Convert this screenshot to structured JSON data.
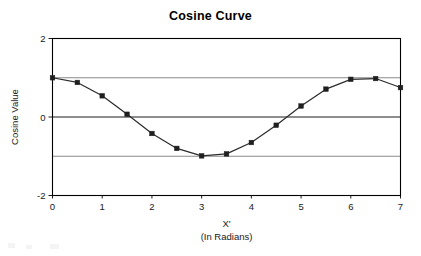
{
  "chart_data": {
    "type": "line",
    "title": "Cosine Curve",
    "xlabel": "X'",
    "xlabel_sub": "(In Radians)",
    "ylabel": "Cosine Value",
    "xlim": [
      0,
      7
    ],
    "ylim": [
      -2,
      2
    ],
    "grid": true,
    "gridlines_y": [
      1,
      0,
      -1
    ],
    "legend": "none",
    "marker": "square",
    "line_color": "#2b2b2b",
    "marker_color": "#1f1f1f",
    "xticks": [
      0,
      1,
      2,
      3,
      4,
      5,
      6,
      7
    ],
    "xtick_labels": [
      "0",
      "1",
      "2",
      "3",
      "4",
      "5",
      "6",
      "7"
    ],
    "yticks": [
      2,
      0,
      -2
    ],
    "ytick_labels": [
      "2",
      "0",
      "-2"
    ],
    "x": [
      0,
      0.5,
      1,
      1.5,
      2,
      2.5,
      3,
      3.5,
      4,
      4.5,
      5,
      5.5,
      6,
      6.5,
      7
    ],
    "values": [
      1,
      0.88,
      0.54,
      0.07,
      -0.42,
      -0.8,
      -0.99,
      -0.94,
      -0.65,
      -0.21,
      0.28,
      0.71,
      0.96,
      0.98,
      0.75
    ],
    "series": [
      {
        "name": "Cosine Value",
        "values": [
          1,
          0.88,
          0.54,
          0.07,
          -0.42,
          -0.8,
          -0.99,
          -0.94,
          -0.65,
          -0.21,
          0.28,
          0.71,
          0.96,
          0.98,
          0.75
        ]
      }
    ]
  }
}
